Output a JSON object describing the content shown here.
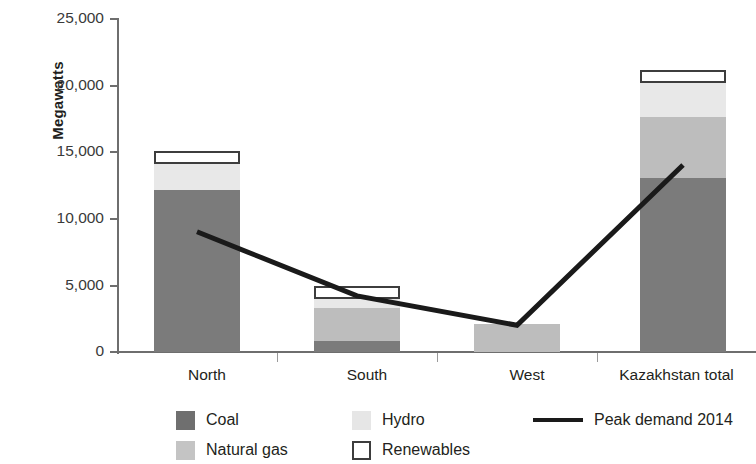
{
  "chart_data": {
    "type": "bar",
    "subtype": "stacked-bar-with-line-overlay",
    "title": "",
    "xlabel": "",
    "ylabel": "Megawatts",
    "ylim": [
      0,
      25000
    ],
    "ytick_values": [
      0,
      5000,
      10000,
      15000,
      20000,
      25000
    ],
    "ytick_labels": [
      "0",
      "5,000",
      "10,000",
      "15,000",
      "20,000",
      "25,000"
    ],
    "grid": false,
    "legend_position": "bottom",
    "categories": [
      "North",
      "South",
      "West",
      "Kazakhstan total"
    ],
    "series": [
      {
        "name": "Coal",
        "type": "bar",
        "color": "#7b7b7b",
        "values": [
          12100,
          800,
          0,
          13000
        ]
      },
      {
        "name": "Natural gas",
        "type": "bar",
        "color": "#bdbdbd",
        "values": [
          0,
          2500,
          2100,
          4600
        ]
      },
      {
        "name": "Hydro",
        "type": "bar",
        "color": "#e8e8e8",
        "values": [
          1950,
          700,
          0,
          2500
        ]
      },
      {
        "name": "Renewables",
        "type": "bar",
        "color": "#ffffff",
        "values": [
          150,
          550,
          0,
          900
        ]
      },
      {
        "name": "Peak demand 2014",
        "type": "line",
        "color": "#1a1a1a",
        "values": [
          9000,
          4200,
          2000,
          14000
        ]
      }
    ],
    "totals": [
      14200,
      4550,
      2100,
      21000
    ]
  },
  "axes": {
    "y_title": "Megawatts",
    "y_ticks": [
      {
        "label": "25,000",
        "value": 25000
      },
      {
        "label": "20,000",
        "value": 20000
      },
      {
        "label": "15,000",
        "value": 15000
      },
      {
        "label": "10,000",
        "value": 10000
      },
      {
        "label": "5,000",
        "value": 5000
      },
      {
        "label": "0",
        "value": 0
      }
    ],
    "x_ticks": [
      {
        "label": "North"
      },
      {
        "label": "South"
      },
      {
        "label": "West"
      },
      {
        "label": "Kazakhstan total"
      }
    ]
  },
  "legend": {
    "coal": "Coal",
    "natural_gas": "Natural gas",
    "hydro": "Hydro",
    "renewables": "Renewables",
    "peak_demand": "Peak demand 2014"
  }
}
